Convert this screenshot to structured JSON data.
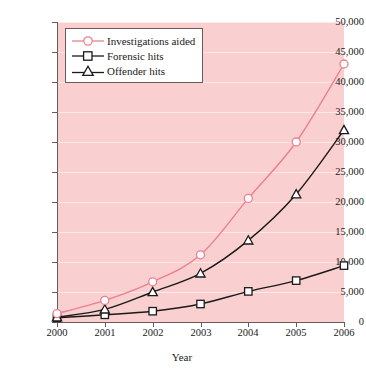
{
  "chart_data": {
    "type": "line",
    "title": "",
    "xlabel": "Year",
    "ylabel": "",
    "x": [
      2000,
      2001,
      2002,
      2003,
      2004,
      2005,
      2006
    ],
    "categories": [
      "2000",
      "2001",
      "2002",
      "2003",
      "2004",
      "2005",
      "2006"
    ],
    "xlim": [
      2000,
      2006
    ],
    "ylim": [
      0,
      50000
    ],
    "ytick_labels": [
      "0",
      "5,000",
      "10,000",
      "15,000",
      "20,000",
      "25,000",
      "30,000",
      "35,000",
      "40,000",
      "45,000",
      "50,000"
    ],
    "ytick_values": [
      0,
      5000,
      10000,
      15000,
      20000,
      25000,
      30000,
      35000,
      40000,
      45000,
      50000
    ],
    "grid": true,
    "grid_color": "#fdeaea",
    "plot_background": "#f9cfcf",
    "legend_position": "top-left",
    "series": [
      {
        "name": "Investigations aided",
        "color": "#e8828f",
        "marker": "circle",
        "values": [
          1400,
          3600,
          6700,
          11200,
          20600,
          30000,
          43000
        ]
      },
      {
        "name": "Forensic hits",
        "color": "#1a1a1a",
        "marker": "square",
        "values": [
          700,
          1200,
          1800,
          3000,
          5100,
          6900,
          9400
        ]
      },
      {
        "name": "Offender hits",
        "color": "#1a1a1a",
        "marker": "triangle",
        "values": [
          800,
          2100,
          5000,
          8100,
          13600,
          21300,
          32000
        ]
      }
    ]
  },
  "legend": {
    "items": [
      {
        "label": "Investigations aided"
      },
      {
        "label": "Forensic hits"
      },
      {
        "label": "Offender hits"
      }
    ]
  }
}
